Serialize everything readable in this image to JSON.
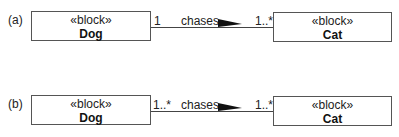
{
  "diagrams": [
    {
      "label": "(a)",
      "source": {
        "stereotype": "«block»",
        "name": "Dog",
        "multiplicity": "1"
      },
      "association": {
        "name": "chases",
        "direction-icon": "filled-triangle-right-icon"
      },
      "target": {
        "stereotype": "«block»",
        "name": "Cat",
        "multiplicity": "1..*"
      }
    },
    {
      "label": "(b)",
      "source": {
        "stereotype": "«block»",
        "name": "Dog",
        "multiplicity": "1..*"
      },
      "association": {
        "name": "chases",
        "direction-icon": "filled-triangle-right-icon"
      },
      "target": {
        "stereotype": "«block»",
        "name": "Cat",
        "multiplicity": "1..*"
      }
    }
  ],
  "colors": {
    "stroke": "#444444",
    "text": "#222222",
    "background": "#ffffff"
  }
}
